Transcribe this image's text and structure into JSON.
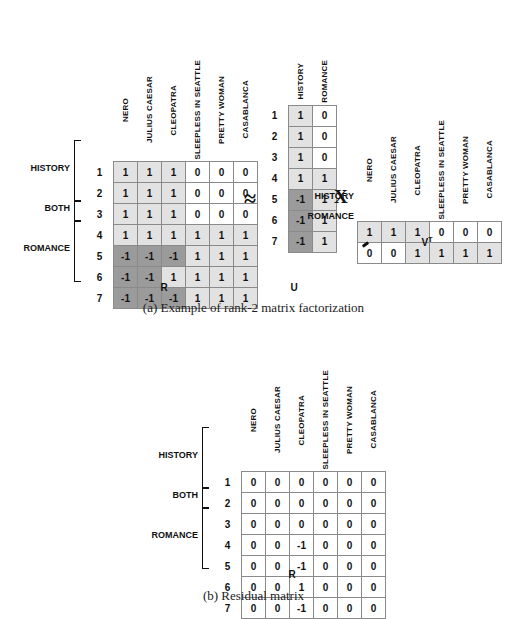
{
  "figure_a": {
    "caption": "(a) Example of rank-2 matrix factorization",
    "movies": [
      "NERO",
      "JULIUS CAESAR",
      "CLEOPATRA",
      "SLEEPLESS IN SEATTLE",
      "PRETTY WOMAN",
      "CASABLANCA"
    ],
    "concepts": [
      "HISTORY",
      "ROMANCE"
    ],
    "row_ids": [
      "1",
      "2",
      "3",
      "4",
      "5",
      "6",
      "7"
    ],
    "groups": [
      {
        "label": "HISTORY",
        "rows": [
          "1",
          "2",
          "3"
        ]
      },
      {
        "label": "BOTH",
        "rows": [
          "4"
        ]
      },
      {
        "label": "ROMANCE",
        "rows": [
          "5",
          "6",
          "7"
        ]
      }
    ],
    "R": {
      "name": "R",
      "rows": [
        {
          "id": "1",
          "values": [
            "1",
            "1",
            "1",
            "0",
            "0",
            "0"
          ],
          "shades": [
            "lite",
            "lite",
            "lite",
            "plain",
            "plain",
            "plain"
          ]
        },
        {
          "id": "2",
          "values": [
            "1",
            "1",
            "1",
            "0",
            "0",
            "0"
          ],
          "shades": [
            "lite",
            "lite",
            "lite",
            "plain",
            "plain",
            "plain"
          ]
        },
        {
          "id": "3",
          "values": [
            "1",
            "1",
            "1",
            "0",
            "0",
            "0"
          ],
          "shades": [
            "lite",
            "lite",
            "lite",
            "plain",
            "plain",
            "plain"
          ]
        },
        {
          "id": "4",
          "values": [
            "1",
            "1",
            "1",
            "1",
            "1",
            "1"
          ],
          "shades": [
            "lite",
            "lite",
            "lite",
            "lite",
            "lite",
            "lite"
          ]
        },
        {
          "id": "5",
          "values": [
            "-1",
            "-1",
            "-1",
            "1",
            "1",
            "1"
          ],
          "shades": [
            "dark",
            "dark",
            "dark",
            "lite",
            "lite",
            "lite"
          ]
        },
        {
          "id": "6",
          "values": [
            "-1",
            "-1",
            "1",
            "1",
            "1",
            "1"
          ],
          "shades": [
            "dark",
            "dark",
            "lite",
            "lite",
            "lite",
            "lite"
          ]
        },
        {
          "id": "7",
          "values": [
            "-1",
            "-1",
            "-1",
            "1",
            "1",
            "1"
          ],
          "shades": [
            "dark",
            "dark",
            "dark",
            "lite",
            "lite",
            "lite"
          ]
        }
      ]
    },
    "U": {
      "name": "U",
      "rows": [
        {
          "id": "1",
          "values": [
            "1",
            "0"
          ],
          "shades": [
            "lite",
            "plain"
          ]
        },
        {
          "id": "2",
          "values": [
            "1",
            "0"
          ],
          "shades": [
            "lite",
            "plain"
          ]
        },
        {
          "id": "3",
          "values": [
            "1",
            "0"
          ],
          "shades": [
            "lite",
            "plain"
          ]
        },
        {
          "id": "4",
          "values": [
            "1",
            "1"
          ],
          "shades": [
            "lite",
            "lite"
          ]
        },
        {
          "id": "5",
          "values": [
            "-1",
            "1"
          ],
          "shades": [
            "dark",
            "lite"
          ]
        },
        {
          "id": "6",
          "values": [
            "-1",
            "1"
          ],
          "shades": [
            "dark",
            "lite"
          ]
        },
        {
          "id": "7",
          "values": [
            "-1",
            "1"
          ],
          "shades": [
            "dark",
            "lite"
          ]
        }
      ]
    },
    "VT": {
      "name": "V",
      "superscript": "T",
      "rows": [
        {
          "label": "HISTORY",
          "values": [
            "1",
            "1",
            "1",
            "0",
            "0",
            "0"
          ],
          "shades": [
            "lite",
            "lite",
            "lite",
            "plain",
            "plain",
            "plain"
          ]
        },
        {
          "label": "ROMANCE",
          "values": [
            "0",
            "0",
            "1",
            "1",
            "1",
            "1"
          ],
          "shades": [
            "plain",
            "plain",
            "lite",
            "lite",
            "lite",
            "lite"
          ]
        }
      ]
    },
    "approx_symbol": "≈",
    "times_symbol": "X"
  },
  "figure_b": {
    "caption": "(b) Residual matrix",
    "movies": [
      "NERO",
      "JULIUS CAESAR",
      "CLEOPATRA",
      "SLEEPLESS IN SEATTLE",
      "PRETTY WOMAN",
      "CASABLANCA"
    ],
    "groups": [
      {
        "label": "HISTORY",
        "rows": [
          "1",
          "2",
          "3"
        ]
      },
      {
        "label": "BOTH",
        "rows": [
          "4"
        ]
      },
      {
        "label": "ROMANCE",
        "rows": [
          "5",
          "6",
          "7"
        ]
      }
    ],
    "R": {
      "name": "R",
      "rows": [
        {
          "id": "1",
          "values": [
            "0",
            "0",
            "0",
            "0",
            "0",
            "0"
          ],
          "shades": [
            "plain",
            "plain",
            "plain",
            "plain",
            "plain",
            "plain"
          ]
        },
        {
          "id": "2",
          "values": [
            "0",
            "0",
            "0",
            "0",
            "0",
            "0"
          ],
          "shades": [
            "plain",
            "plain",
            "plain",
            "plain",
            "plain",
            "plain"
          ]
        },
        {
          "id": "3",
          "values": [
            "0",
            "0",
            "0",
            "0",
            "0",
            "0"
          ],
          "shades": [
            "plain",
            "plain",
            "plain",
            "plain",
            "plain",
            "plain"
          ]
        },
        {
          "id": "4",
          "values": [
            "0",
            "0",
            "-1",
            "0",
            "0",
            "0"
          ],
          "shades": [
            "plain",
            "plain",
            "plain",
            "plain",
            "plain",
            "plain"
          ]
        },
        {
          "id": "5",
          "values": [
            "0",
            "0",
            "-1",
            "0",
            "0",
            "0"
          ],
          "shades": [
            "plain",
            "plain",
            "plain",
            "plain",
            "plain",
            "plain"
          ]
        },
        {
          "id": "6",
          "values": [
            "0",
            "0",
            "1",
            "0",
            "0",
            "0"
          ],
          "shades": [
            "plain",
            "plain",
            "plain",
            "plain",
            "plain",
            "plain"
          ]
        },
        {
          "id": "7",
          "values": [
            "0",
            "0",
            "-1",
            "0",
            "0",
            "0"
          ],
          "shades": [
            "plain",
            "plain",
            "plain",
            "plain",
            "plain",
            "plain"
          ]
        }
      ]
    }
  },
  "colors": {
    "light_cell": "#e2e2e2",
    "dark_cell": "#9b9b9b",
    "border": "#8a8a8a",
    "text": "#111111"
  }
}
